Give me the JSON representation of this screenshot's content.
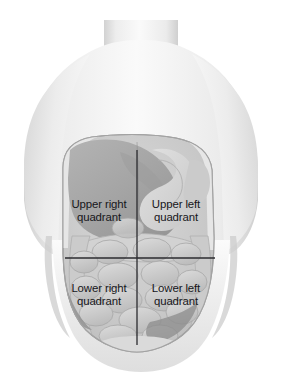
{
  "figure": {
    "background_color": "#ffffff"
  },
  "labels": {
    "upper_right": {
      "line1": "Upper right",
      "line2": "quadrant"
    },
    "upper_left": {
      "line1": "Upper left",
      "line2": "quadrant"
    },
    "lower_right": {
      "line1": "Lower right",
      "line2": "quadrant"
    },
    "lower_left": {
      "line1": "Lower left",
      "line2": "quadrant"
    }
  },
  "colors": {
    "text": "#16161a",
    "crosshair": "#2b2b2f",
    "skin_light": "#f4f4f4",
    "skin_mid": "#e3e3e3",
    "skin_shadow": "#cfcfcf",
    "cavity_base": "#c9c9c9",
    "liver": "#a8a8a8",
    "liver_dark": "#9a9a9a",
    "stomach": "#d6d6d6",
    "intestine": "#c2c2c2",
    "intestine_light": "#dcdcdc",
    "outline": "#8e8e8e"
  },
  "crosshair": {
    "vertical_x": 137,
    "vertical_y_top": 150,
    "vertical_y_bottom": 345,
    "horizontal_y": 258,
    "horizontal_x_left": 65,
    "horizontal_x_right": 215,
    "stroke_width": 1.3
  },
  "anatomy": {
    "parts": [
      "neck",
      "shoulders",
      "left-arm-stub",
      "right-arm-stub",
      "torso",
      "abdominal-cavity",
      "liver",
      "stomach",
      "spleen",
      "small-intestine",
      "large-intestine",
      "pelvic-brim"
    ]
  }
}
